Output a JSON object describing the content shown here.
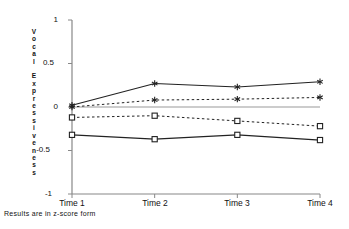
{
  "caption": "Results are in z-score form",
  "axis": {
    "ylabel_text": "V\no\nc\na\nl\n\nE\nx\np\nr\ne\ns\ns\ni\nv\ne\nn\ne\ns\ns",
    "ylabel_plain": "Vocal Expressiveness",
    "ytick_1": "1",
    "ytick_05": "0.5",
    "ytick_0": "0",
    "ytick_n05": "-0.5",
    "ytick_n1": "-1",
    "xtick_1": "Time 1",
    "xtick_2": "Time 2",
    "xtick_3": "Time 3",
    "xtick_4": "Time 4"
  },
  "chart_data": {
    "type": "line",
    "title": "",
    "xlabel": "",
    "ylabel": "Vocal Expressiveness",
    "categories": [
      "Time 1",
      "Time 2",
      "Time 3",
      "Time 4"
    ],
    "ylim": [
      -1,
      1
    ],
    "yticks": [
      1,
      0.5,
      0,
      -0.5,
      -1
    ],
    "grid": false,
    "legend": "none",
    "annotation": "Results are in z-score form",
    "series": [
      {
        "name": "series-1-asterisk-solid",
        "marker": "asterisk",
        "linestyle": "solid",
        "color": "#222222",
        "values": [
          0.02,
          0.27,
          0.23,
          0.29
        ]
      },
      {
        "name": "series-2-asterisk-dotted",
        "marker": "asterisk",
        "linestyle": "dotted",
        "color": "#222222",
        "values": [
          0.0,
          0.08,
          0.09,
          0.11
        ]
      },
      {
        "name": "series-3-square-dotted",
        "marker": "square",
        "linestyle": "dotted",
        "color": "#222222",
        "values": [
          -0.12,
          -0.1,
          -0.16,
          -0.22
        ]
      },
      {
        "name": "series-4-square-solid",
        "marker": "square",
        "linestyle": "solid",
        "color": "#222222",
        "values": [
          -0.32,
          -0.37,
          -0.32,
          -0.38
        ]
      }
    ]
  }
}
